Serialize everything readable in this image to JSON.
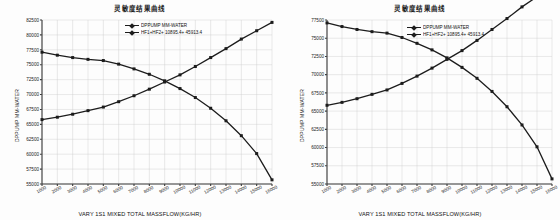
{
  "page": {
    "background": "#fdfdfd",
    "accent": "#1c1c1c"
  },
  "charts": [
    {
      "id": "left",
      "title": "灵敏度结果曲线",
      "xlabel": "VARY  1S1 MIXED TOTAL MASSFLOW(KG/HR)",
      "ylabel": "DPPUMP MM-WATER",
      "legend": [
        "DPPUMP MM-WATER",
        "HF1+HF2+ 10895.4+ 45913.4"
      ]
    },
    {
      "id": "right",
      "title": "灵敏度结果曲线",
      "xlabel": "VARY  1S1 MIXED TOTAL MASSFLOW(KG/HR)",
      "ylabel": "DPPUMP MM-WATER",
      "legend": [
        "DPPUMP MM-WATER",
        "HF1+HF2+ 10895.4+ 45913.4"
      ]
    }
  ],
  "chart_data": [
    {
      "type": "line",
      "id": "left",
      "title": "灵敏度结果曲线",
      "xlabel": "VARY  1S1 MIXED TOTAL MASSFLOW(KG/HR)",
      "ylabel": "DPPUMP MM-WATER",
      "grid": true,
      "legend_position": "top-center",
      "xlim": [
        1000,
        16000
      ],
      "ylim": [
        55000,
        82500
      ],
      "xticks": [
        1000,
        2000,
        3000,
        4000,
        5000,
        6000,
        7000,
        8000,
        9000,
        10000,
        11000,
        12000,
        13000,
        14000,
        15000,
        16000
      ],
      "yticks": [
        55000,
        57500,
        60000,
        62500,
        65000,
        67500,
        70000,
        72500,
        75000,
        77500,
        80000,
        82500
      ],
      "x": [
        1000,
        2000,
        3000,
        4000,
        5000,
        6000,
        7000,
        8000,
        9000,
        10000,
        11000,
        12000,
        13000,
        14000,
        15000,
        16000
      ],
      "series": [
        {
          "name": "DPPUMP MM-WATER",
          "values": [
            77100,
            76600,
            76200,
            75900,
            75700,
            75100,
            74300,
            73400,
            72300,
            71000,
            69500,
            67700,
            65600,
            63100,
            60100,
            55700
          ]
        },
        {
          "name": "HF1+HF2+ 10895.4+ 45913.4",
          "values": [
            65800,
            66200,
            66700,
            67300,
            67900,
            68800,
            69800,
            70900,
            72100,
            73300,
            74700,
            76200,
            77700,
            79300,
            80700,
            82100
          ]
        }
      ],
      "intersection": {
        "x": 10000,
        "y": 72400
      }
    },
    {
      "type": "line",
      "id": "right",
      "title": "灵敏度结果曲线",
      "xlabel": "VARY  1S1 MIXED TOTAL MASSFLOW(KG/HR)",
      "ylabel": "DPPUMP MM-WATER",
      "grid": true,
      "legend_position": "top-center",
      "xlim": [
        1000,
        16000
      ],
      "ylim": [
        55000,
        77500
      ],
      "xticks": [
        1000,
        2000,
        3000,
        4000,
        5000,
        6000,
        7000,
        8000,
        9000,
        10000,
        11000,
        12000,
        13000,
        14000,
        15000,
        16000
      ],
      "yticks": [
        55000,
        57500,
        60000,
        62500,
        65000,
        67500,
        70000,
        72500,
        75000,
        77500
      ],
      "x": [
        1000,
        2000,
        3000,
        4000,
        5000,
        6000,
        7000,
        8000,
        9000,
        10000,
        11000,
        12000,
        13000,
        14000,
        15000,
        16000
      ],
      "series": [
        {
          "name": "DPPUMP MM-WATER",
          "values": [
            77100,
            76600,
            76200,
            75900,
            75700,
            75100,
            74300,
            73400,
            72300,
            71000,
            69500,
            67700,
            65600,
            63100,
            60100,
            55700
          ]
        },
        {
          "name": "HF1+HF2+ 10895.4+ 45913.4",
          "values": [
            65800,
            66200,
            66700,
            67300,
            67900,
            68800,
            69800,
            70900,
            72100,
            73300,
            74700,
            76200,
            77700,
            79300,
            80700,
            82100
          ]
        }
      ],
      "intersection": {
        "x": 10800,
        "y": 70900
      }
    }
  ]
}
